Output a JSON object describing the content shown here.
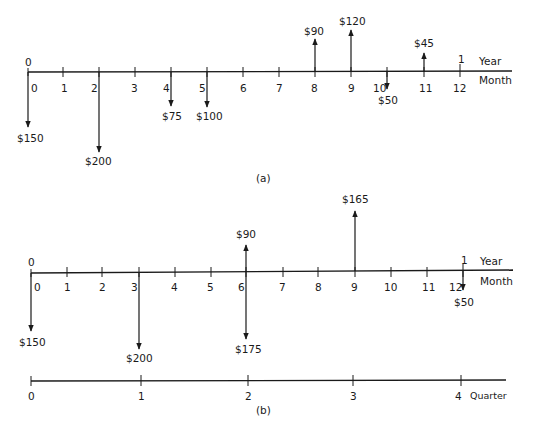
{
  "diagram_a": {
    "caption": "(a)",
    "year_start_label": "0",
    "year_end_label": "1",
    "year_axis_label": "Year",
    "month_axis_label": "Month",
    "month_ticks": [
      "0",
      "1",
      "2",
      "3",
      "4",
      "5",
      "6",
      "7",
      "8",
      "9",
      "10",
      "11",
      "12"
    ],
    "cash_flows": [
      {
        "month": 0,
        "direction": "down",
        "amount": "$150"
      },
      {
        "month": 2,
        "direction": "down",
        "amount": "$200"
      },
      {
        "month": 4,
        "direction": "down",
        "amount": "$75"
      },
      {
        "month": 5,
        "direction": "down",
        "amount": "$100"
      },
      {
        "month": 8,
        "direction": "up",
        "amount": "$90"
      },
      {
        "month": 9,
        "direction": "up",
        "amount": "$120"
      },
      {
        "month": 10,
        "direction": "down",
        "amount": "$50"
      },
      {
        "month": 11,
        "direction": "up",
        "amount": "$45"
      }
    ]
  },
  "diagram_b": {
    "caption": "(b)",
    "year_start_label": "0",
    "year_end_label": "1",
    "year_axis_label": "Year",
    "month_axis_label": "Month",
    "month_ticks": [
      "0",
      "1",
      "2",
      "3",
      "4",
      "5",
      "6",
      "7",
      "8",
      "9",
      "10",
      "11",
      "12"
    ],
    "cash_flows": [
      {
        "month": 0,
        "direction": "down",
        "amount": "$150"
      },
      {
        "month": 3,
        "direction": "down",
        "amount": "$200"
      },
      {
        "month": 6,
        "direction": "up",
        "amount": "$90"
      },
      {
        "month": 6,
        "direction": "down",
        "amount": "$175"
      },
      {
        "month": 9,
        "direction": "up",
        "amount": "$165"
      },
      {
        "month": 12,
        "direction": "down",
        "amount": "$50"
      }
    ],
    "quarter_axis_label": "Quarter",
    "quarter_ticks": [
      "0",
      "1",
      "2",
      "3",
      "4"
    ]
  }
}
